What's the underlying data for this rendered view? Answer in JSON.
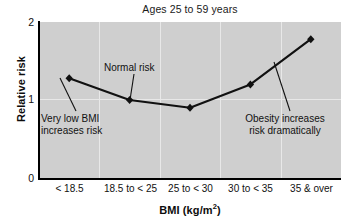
{
  "chart_data": {
    "type": "line",
    "title": "Ages 25 to 59 years",
    "xlabel": "BMI (kg/m2)",
    "xlabel_main": "BMI (kg/m",
    "xlabel_sup": "2",
    "xlabel_tail": ")",
    "ylabel": "Relative risk",
    "categories": [
      "< 18.5",
      "18.5 to < 25",
      "25 to < 30",
      "30 to < 35",
      "35 & over"
    ],
    "values": [
      1.28,
      1.0,
      0.9,
      1.2,
      1.78
    ],
    "ylim": [
      0,
      2
    ],
    "yticks": [
      "0",
      "1",
      "2"
    ],
    "ytick_values": [
      0,
      1,
      2
    ],
    "grid": true,
    "legend": "none",
    "marker": "diamond",
    "series_color": "#111111",
    "plot_background": "#cfcfcf",
    "gridline_color": "#e8e8e8",
    "annotations": [
      {
        "id": "very-low-bmi",
        "text": "Very low BMI\nincreases risk",
        "points_to_category": "< 18.5",
        "points_to_value": 1.28
      },
      {
        "id": "normal-risk",
        "text": "Normal risk",
        "points_to_category": "18.5 to < 25",
        "points_to_value": 1.0
      },
      {
        "id": "obesity",
        "text": "Obesity increases\nrisk dramatically",
        "points_to_category": "35 & over",
        "points_to_value": 1.78
      }
    ]
  }
}
